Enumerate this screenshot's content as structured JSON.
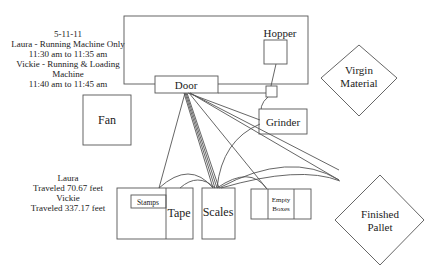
{
  "notes": {
    "date": "5-11-11",
    "line1": "Laura - Running Machine Only",
    "line2": "11:30 am to 11:35 am",
    "line3": "Vickie - Running & Loading",
    "line4": "Machine",
    "line5": "11:40 am to 11:45 am"
  },
  "distances": {
    "laura_name": "Laura",
    "laura_dist": "Traveled 70.67 feet",
    "vickie_name": "Vickie",
    "vickie_dist": "Traveled 337.17 feet"
  },
  "stations": {
    "hopper": "Hopper",
    "door": "Door",
    "fan": "Fan",
    "grinder": "Grinder",
    "virgin_1": "Virgin",
    "virgin_2": "Material",
    "stamps": "Stamps",
    "tape": "Tape",
    "scales": "Scales",
    "empty_1": "Empty",
    "empty_2": "Boxes",
    "pallet_1": "Finished",
    "pallet_2": "Pallet"
  },
  "colors": {
    "stroke": "#555555",
    "text": "#222222",
    "background": "#ffffff"
  }
}
